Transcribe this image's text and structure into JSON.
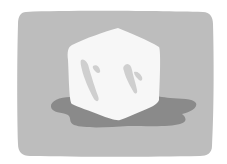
{
  "illustration": {
    "subject": "melting ice cube",
    "colors": {
      "background": "#ffffff",
      "panel": "#bdbdbd",
      "puddle": "#8a8a8a",
      "cube": "#f7f7f7",
      "highlight": "#cfcfcf"
    }
  }
}
